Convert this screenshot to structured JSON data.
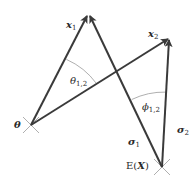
{
  "diagram": {
    "title": "",
    "colors": {
      "vector": "#3a3a3a",
      "arc": "#9a9a9a",
      "cross": "#9a9a9a",
      "text": "#2a2a2a",
      "background": "#ffffff"
    },
    "points": {
      "origin": {
        "label": "θ",
        "x": 31,
        "y": 125
      },
      "x1": {
        "label": "x",
        "sub": "1",
        "x": 88,
        "y": 14
      },
      "x2": {
        "label": "x",
        "sub": "2",
        "x": 170,
        "y": 38
      },
      "mean": {
        "label": "E(X)",
        "x": 162,
        "y": 167
      }
    },
    "labels": {
      "x1_main": "x",
      "x1_sub": "1",
      "x2_main": "x",
      "x2_sub": "2",
      "theta_point": "θ",
      "mean_E": "E(",
      "mean_X": "X",
      "mean_close": ")",
      "theta_angle_main": "θ",
      "theta_angle_sub": "1,2",
      "phi_angle_main": "ϕ",
      "phi_angle_sub": "1,2",
      "sigma1_main": "σ",
      "sigma1_sub": "1",
      "sigma2_main": "σ",
      "sigma2_sub": "2"
    },
    "edges": [
      {
        "from": "origin",
        "to": "x1",
        "arrow": true
      },
      {
        "from": "origin",
        "to": "x2",
        "arrow": true
      },
      {
        "from": "mean",
        "to": "x1",
        "arrow": true
      },
      {
        "from": "mean",
        "to": "x2",
        "arrow": true
      }
    ],
    "angles": [
      {
        "name": "theta_1_2",
        "vertex": "origin",
        "between": [
          "x1",
          "x2"
        ]
      },
      {
        "name": "phi_1_2",
        "vertex": "mean",
        "between": [
          "x1",
          "x2"
        ]
      }
    ]
  }
}
